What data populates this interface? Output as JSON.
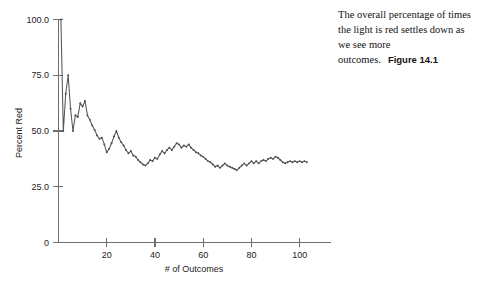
{
  "caption": {
    "text": "The overall percentage of times the light is red settles down as we see more outcomes.",
    "figure_number": "Figure 14.1"
  },
  "chart_data": {
    "type": "line",
    "title": "",
    "xlabel": "# of Outcomes",
    "ylabel": "Percent Red",
    "xlim": [
      0,
      113
    ],
    "ylim": [
      0,
      100
    ],
    "xticks": [
      20,
      40,
      60,
      80,
      100
    ],
    "xtick_labels": [
      "20",
      "40",
      "60",
      "80",
      "100"
    ],
    "yticks": [
      0,
      25,
      50,
      75,
      100
    ],
    "ytick_labels": [
      "0",
      "25.0",
      "50.0",
      "75.0",
      "100.0"
    ],
    "grid": false,
    "legend": null,
    "series": [
      {
        "name": "Percent Red",
        "color": "#555555",
        "marker": "dot",
        "x": [
          1,
          2,
          3,
          4,
          5,
          6,
          7,
          8,
          9,
          10,
          11,
          12,
          13,
          14,
          15,
          16,
          17,
          18,
          19,
          20,
          21,
          22,
          23,
          24,
          25,
          26,
          27,
          28,
          29,
          30,
          31,
          32,
          33,
          34,
          35,
          36,
          37,
          38,
          39,
          40,
          41,
          42,
          43,
          44,
          45,
          46,
          47,
          48,
          49,
          50,
          51,
          52,
          53,
          54,
          55,
          56,
          57,
          58,
          59,
          60,
          61,
          62,
          63,
          64,
          65,
          66,
          67,
          68,
          69,
          70,
          71,
          72,
          73,
          74,
          75,
          76,
          77,
          78,
          79,
          80,
          81,
          82,
          83,
          84,
          85,
          86,
          87,
          88,
          89,
          90,
          91,
          92,
          93,
          94,
          95,
          96,
          97,
          98,
          99,
          100,
          101,
          102,
          103
        ],
        "values": [
          100.0,
          50.0,
          66.7,
          75.0,
          60.0,
          50.0,
          57.1,
          56.3,
          62.5,
          61.0,
          63.5,
          57.0,
          55.0,
          52.5,
          50.5,
          48.0,
          46.5,
          47.0,
          44.0,
          40.5,
          42.0,
          44.5,
          47.5,
          50.0,
          47.0,
          45.0,
          43.5,
          41.5,
          40.0,
          41.0,
          39.0,
          38.5,
          37.0,
          36.0,
          35.0,
          34.5,
          35.5,
          37.0,
          36.5,
          38.0,
          37.5,
          39.5,
          41.0,
          40.0,
          41.5,
          42.5,
          41.5,
          43.0,
          44.5,
          44.0,
          42.5,
          43.5,
          43.0,
          44.0,
          42.5,
          41.5,
          40.5,
          40.0,
          39.0,
          38.5,
          37.5,
          36.5,
          36.0,
          35.0,
          34.0,
          34.5,
          33.5,
          34.5,
          35.5,
          34.5,
          34.0,
          33.5,
          33.0,
          32.5,
          33.5,
          34.5,
          35.5,
          34.5,
          35.5,
          36.5,
          35.5,
          36.5,
          35.5,
          36.5,
          37.0,
          36.5,
          37.5,
          38.0,
          37.5,
          38.5,
          38.0,
          37.0,
          36.0,
          35.5,
          36.0,
          36.5,
          36.0,
          36.5,
          36.0,
          36.5,
          36.0,
          36.5,
          36.0
        ]
      }
    ]
  }
}
